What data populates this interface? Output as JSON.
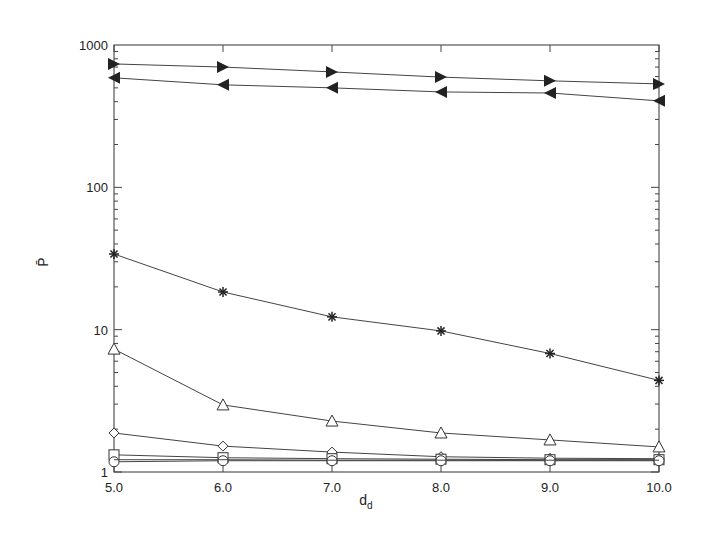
{
  "chart_data": {
    "type": "line",
    "title": "",
    "xlabel": "d_d",
    "ylabel": "P̄",
    "x": [
      5.0,
      6.0,
      7.0,
      8.0,
      9.0,
      10.0
    ],
    "x_tick_labels": [
      "5.0",
      "6.0",
      "7.0",
      "8.0",
      "9.0",
      "10.0"
    ],
    "y_scale": "log",
    "ylim": [
      1,
      1000
    ],
    "xlim": [
      5.0,
      10.0
    ],
    "y_tick_labels": [
      "1",
      "10",
      "100",
      "1000"
    ],
    "grid": false,
    "legend": null,
    "series": [
      {
        "name": "right-triangle",
        "marker": "triangle-right-filled",
        "values": [
          736,
          700,
          647,
          595,
          560,
          533
        ]
      },
      {
        "name": "left-triangle",
        "marker": "triangle-left-filled",
        "values": [
          588,
          525,
          500,
          468,
          460,
          405
        ]
      },
      {
        "name": "star",
        "marker": "star",
        "values": [
          34,
          18.4,
          12.3,
          9.8,
          6.8,
          4.4
        ]
      },
      {
        "name": "triangle-up",
        "marker": "triangle-up-open",
        "values": [
          7.3,
          2.96,
          2.28,
          1.88,
          1.68,
          1.5
        ]
      },
      {
        "name": "diamond",
        "marker": "diamond-open",
        "values": [
          1.88,
          1.52,
          1.38,
          1.28,
          1.25,
          1.24
        ]
      },
      {
        "name": "square",
        "marker": "square-open",
        "values": [
          1.32,
          1.26,
          1.24,
          1.23,
          1.22,
          1.22
        ]
      },
      {
        "name": "circle",
        "marker": "circle-open",
        "values": [
          1.18,
          1.2,
          1.2,
          1.2,
          1.2,
          1.2
        ]
      },
      {
        "name": "plain",
        "marker": "none",
        "values": [
          1.22,
          1.22,
          1.21,
          1.21,
          1.21,
          1.21
        ]
      }
    ]
  }
}
